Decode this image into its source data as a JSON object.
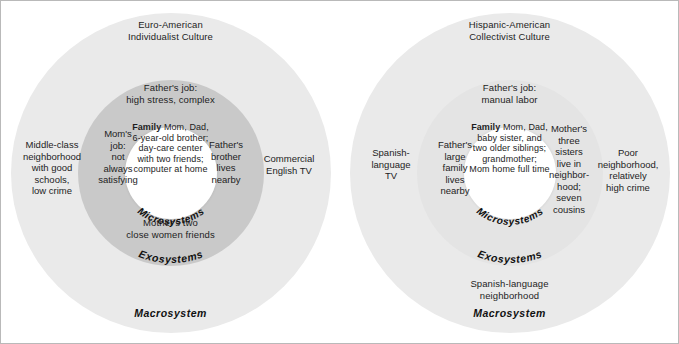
{
  "panels": [
    {
      "id": "euro-american",
      "culture_title": "Euro-American\nIndividualist Culture",
      "fathers_job": "Father's job:\nhigh stress, complex",
      "family_heading": "Family",
      "family_body": "Mom, Dad,\n6-year-old brother;\nday-care center\nwith two friends;\ncomputer at home",
      "exo_left": "Mom's\njob:\nnot\nalways\nsatisfying",
      "exo_right": "Father's\nbrother\nlives\nnearby",
      "exo_bottom": "Mother's two\nclose women friends",
      "macro_left": "Middle-class\nneighborhood\nwith good\nschools,\nlow crime",
      "macro_right": "Commercial\nEnglish TV",
      "macro_bottom": "",
      "label_micro": "Microsystems",
      "label_exo": "Exosystems",
      "label_macro": "Macrosystem",
      "colors": {
        "macrosystem": "#eaeaea",
        "exosystem": "#c9c9c9",
        "microsystem": "#ffffff"
      }
    },
    {
      "id": "hispanic-american",
      "culture_title": "Hispanic-American\nCollectivist Culture",
      "fathers_job": "Father's job:\nmanual labor",
      "family_heading": "Family",
      "family_body": "Mom, Dad,\nbaby sister, and\ntwo older siblings;\ngrandmother;\nMom home full time",
      "exo_left": "Father's\nlarge\nfamily\nlives\nnearby",
      "exo_right": "Mother's\nthree\nsisters\nlive in\nneighbor-\nhood;\nseven\ncousins",
      "exo_bottom": "",
      "macro_left": "Spanish-\nlanguage\nTV",
      "macro_right": "Poor\nneighborhood,\nrelatively\nhigh crime",
      "macro_bottom": "Spanish-language\nneighborhood",
      "label_micro": "Microsystems",
      "label_exo": "Exosystems",
      "label_macro": "Macrosystem",
      "colors": {
        "macrosystem": "#eaeaea",
        "exosystem": "#e4e4e4",
        "microsystem": "#ffffff"
      }
    }
  ]
}
